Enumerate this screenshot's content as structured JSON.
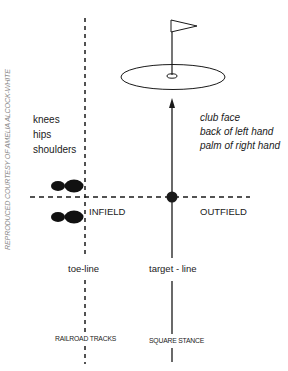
{
  "credit": "REPRODUCED COURTESY OF AMELIA ALCOCK-WHITE",
  "body_alignment": {
    "items": [
      "knees",
      "hips",
      "shoulders"
    ]
  },
  "hand_alignment": {
    "items": [
      "club face",
      "back of left hand",
      "palm of right hand"
    ]
  },
  "zones": {
    "infield": "INFIELD",
    "outfield": "OUTFIELD"
  },
  "lines": {
    "toe_line": "toe-line",
    "target_line": "target - line"
  },
  "captions": {
    "railroad_tracks": "RAILROAD TRACKS",
    "square_stance": "SQUARE STANCE"
  },
  "colors": {
    "ink": "#1a1a1a",
    "credit": "#8a8a8a",
    "background": "#ffffff"
  }
}
